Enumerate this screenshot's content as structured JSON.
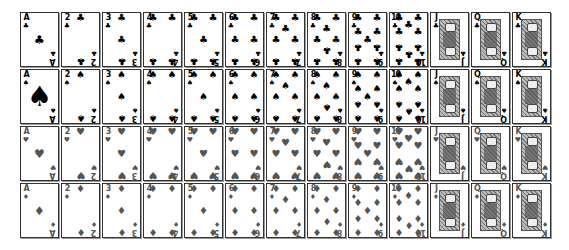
{
  "ranks": [
    "A",
    "2",
    "3",
    "4",
    "5",
    "6",
    "7",
    "8",
    "9",
    "10",
    "J",
    "Q",
    "K"
  ],
  "suits": [
    {
      "name": "clubs",
      "glyph": "♣",
      "color": "#000000"
    },
    {
      "name": "spades",
      "glyph": "♠",
      "color": "#000000"
    },
    {
      "name": "hearts",
      "glyph": "♥",
      "color": "#555555"
    },
    {
      "name": "diamonds",
      "glyph": "♦",
      "color": "#555555"
    }
  ],
  "layout": {
    "card_pitch_x": 41,
    "card_pitch_y": 57
  }
}
